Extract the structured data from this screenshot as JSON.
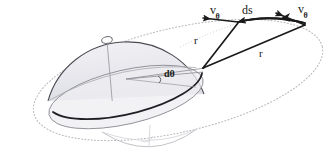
{
  "figure": {
    "background_color": "#ffffff",
    "ink_color": "#1a1a1a",
    "faint_color": "#b9b9bd",
    "shade_color": "#e9e9ee"
  },
  "labels": {
    "v_theta_left": {
      "symbol": "v",
      "subscript": "θ",
      "x": 210,
      "y": 4
    },
    "ds": {
      "text": "ds",
      "x": 242,
      "y": 4
    },
    "v_theta_right": {
      "symbol": "v",
      "subscript": "θ",
      "x": 298,
      "y": 3
    },
    "r_short": {
      "text": "r",
      "x": 194,
      "y": 35
    },
    "r_long": {
      "text": "r",
      "x": 259,
      "y": 48
    },
    "d_theta": {
      "text": "dθ",
      "x": 164,
      "y": 69
    }
  },
  "geometry": {
    "sphere_center": {
      "x": 126,
      "y": 79
    },
    "apex_vertex": {
      "x": 203,
      "y": 68
    },
    "mid_vertex": {
      "x": 238,
      "y": 23
    },
    "right_vertex": {
      "x": 305,
      "y": 25
    },
    "marker_point": {
      "x": 107,
      "y": 40
    },
    "outer_orbit_rx": 148,
    "outer_orbit_ry": 52,
    "dome_radius": 78
  },
  "elements": {
    "outer_orbit": "dotted-ellipse",
    "upper_hemisphere": "shaded-dome",
    "equatorial_disk": "ellipse",
    "lower_hemisphere": "faint-arc",
    "radius_vector_short": "line",
    "radius_vector_long": "line",
    "arc_element_ds": "arrowed-line",
    "velocity_vector_left": "arrow",
    "velocity_vector_right": "arrow",
    "angle_marker": "arc"
  }
}
